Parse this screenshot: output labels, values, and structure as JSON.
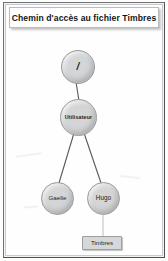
{
  "page": {
    "title": "Chemin d'accès au fichier Timbres"
  },
  "diagram": {
    "type": "tree",
    "orientation": "top-down",
    "nodes": [
      {
        "id": "root",
        "label": "/",
        "shape": "circle",
        "x": 78,
        "y": 67
      },
      {
        "id": "utilisateur",
        "label": "Utilisateur",
        "shape": "circle",
        "x": 78,
        "y": 117
      },
      {
        "id": "gaelle",
        "label": "Gaelle",
        "shape": "circle",
        "x": 57,
        "y": 198
      },
      {
        "id": "hugo",
        "label": "Hugo",
        "shape": "circle",
        "x": 103,
        "y": 198
      },
      {
        "id": "timbres",
        "label": "Timbres",
        "shape": "rect",
        "x": 102,
        "y": 243
      }
    ],
    "edges": [
      {
        "from": "root",
        "to": "utilisateur",
        "style": "dark"
      },
      {
        "from": "utilisateur",
        "to": "gaelle",
        "style": "dark"
      },
      {
        "from": "utilisateur",
        "to": "hugo",
        "style": "dark"
      },
      {
        "from": "hugo",
        "to": "timbres",
        "style": "light"
      }
    ],
    "path": "/Utilisateur/Hugo/Timbres"
  },
  "colors": {
    "node_fill": "#d4d5d6",
    "node_stroke": "#9a9c9e",
    "edge_dark": "#55575a",
    "edge_light": "#bcbec0",
    "page_border": "#6f7175",
    "title_text": "#14161a",
    "background": "#fefefe"
  }
}
